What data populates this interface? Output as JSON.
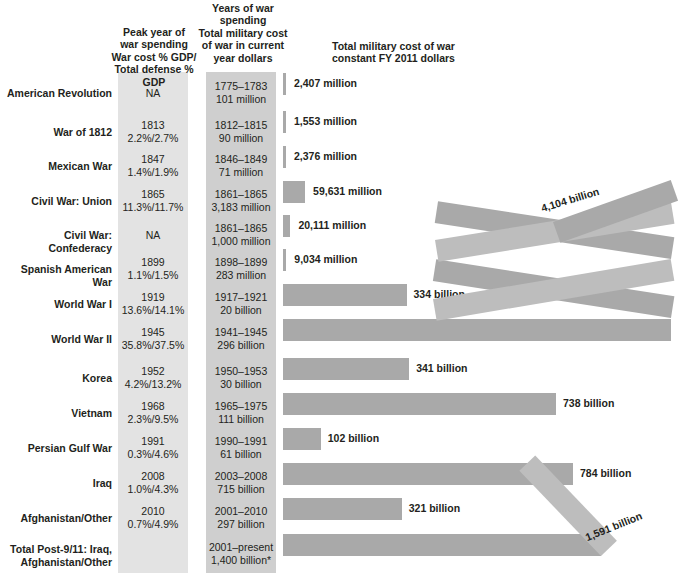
{
  "headers": {
    "war_name": "",
    "peak": "Peak year of\nwar spending\nWar cost % GDP/\nTotal defense % GDP",
    "peak_l1": "Peak year of",
    "peak_l2": "war spending",
    "peak_l3": "War cost % GDP/",
    "peak_l4": "Total defense % GDP",
    "years_l1": "Years of war",
    "years_l2": "spending",
    "years_l3": "Total military cost",
    "years_l4": "of war in current",
    "years_l5": "year dollars",
    "chart_l1": "Total military cost of war",
    "chart_l2": "constant FY 2011 dollars"
  },
  "footnote": "*",
  "colors": {
    "bar": "#a9a9a9",
    "bar_fold": "#bdbdbd",
    "band_peak": "#e3e3e3",
    "band_years": "#cfcfcf",
    "text": "#231f20"
  },
  "chart_data": {
    "type": "bar",
    "title": "Total military cost of war constant FY 2011 dollars",
    "xlabel": "Constant FY 2011 dollars",
    "ylabel": "War",
    "orientation": "horizontal",
    "grid": false,
    "legend": false,
    "note": "Values in billions of constant FY 2011 dollars; million-scale wars drawn as minimal stubs. Two largest bars (World War II and Total Post-9/11) are drawn as folded ribbons that wrap back across the chart.",
    "categories": [
      "American Revolution",
      "War of 1812",
      "Mexican War",
      "Civil War: Union",
      "Civil War: Confederacy",
      "Spanish American War",
      "World War I",
      "World War II",
      "Korea",
      "Vietnam",
      "Persian Gulf War",
      "Iraq",
      "Afghanistan/Other",
      "Total Post-9/11: Iraq, Afghanistan/Other"
    ],
    "values_billions": [
      2.407,
      1.553,
      2.376,
      59.631,
      20.111,
      9.034,
      334,
      4104,
      341,
      738,
      102,
      784,
      321,
      1591
    ],
    "value_labels": [
      "2,407 million",
      "1,553 million",
      "2,376 million",
      "59,631 million",
      "20,111 million",
      "9,034 million",
      "334 billion",
      "4,104 billion",
      "341 billion",
      "738 billion",
      "102 billion",
      "784 billion",
      "321 billion",
      "1,591 billion"
    ]
  },
  "rows": [
    {
      "name_l1": "American Revolution",
      "name_l2": "",
      "peak_year": "NA",
      "peak_pct": "",
      "years": "1775–1783",
      "cost": "101 million",
      "bar_label": "2,407 million"
    },
    {
      "name_l1": "War of 1812",
      "name_l2": "",
      "peak_year": "1813",
      "peak_pct": "2.2%/2.7%",
      "years": "1812–1815",
      "cost": "90 million",
      "bar_label": "1,553 million"
    },
    {
      "name_l1": "Mexican War",
      "name_l2": "",
      "peak_year": "1847",
      "peak_pct": "1.4%/1.9%",
      "years": "1846–1849",
      "cost": "71 million",
      "bar_label": "2,376 million"
    },
    {
      "name_l1": "Civil War: Union",
      "name_l2": "",
      "peak_year": "1865",
      "peak_pct": "11.3%/11.7%",
      "years": "1861–1865",
      "cost": "3,183 million",
      "bar_label": "59,631 million"
    },
    {
      "name_l1": "Civil War: Confederacy",
      "name_l2": "",
      "peak_year": "NA",
      "peak_pct": "",
      "years": "1861–1865",
      "cost": "1,000 million",
      "bar_label": "20,111 million"
    },
    {
      "name_l1": "Spanish American War",
      "name_l2": "",
      "peak_year": "1899",
      "peak_pct": "1.1%/1.5%",
      "years": "1898–1899",
      "cost": "283 million",
      "bar_label": "9,034 million"
    },
    {
      "name_l1": "World War I",
      "name_l2": "",
      "peak_year": "1919",
      "peak_pct": "13.6%/14.1%",
      "years": "1917–1921",
      "cost": "20 billion",
      "bar_label": "334 billion"
    },
    {
      "name_l1": "World War II",
      "name_l2": "",
      "peak_year": "1945",
      "peak_pct": "35.8%/37.5%",
      "years": "1941–1945",
      "cost": "296 billion",
      "bar_label": "4,104 billion"
    },
    {
      "name_l1": "Korea",
      "name_l2": "",
      "peak_year": "1952",
      "peak_pct": "4.2%/13.2%",
      "years": "1950–1953",
      "cost": "30 billion",
      "bar_label": "341 billion"
    },
    {
      "name_l1": "Vietnam",
      "name_l2": "",
      "peak_year": "1968",
      "peak_pct": "2.3%/9.5%",
      "years": "1965–1975",
      "cost": "111 billion",
      "bar_label": "738 billion"
    },
    {
      "name_l1": "Persian Gulf War",
      "name_l2": "",
      "peak_year": "1991",
      "peak_pct": "0.3%/4.6%",
      "years": "1990–1991",
      "cost": "61 billion",
      "bar_label": "102 billion"
    },
    {
      "name_l1": "Iraq",
      "name_l2": "",
      "peak_year": "2008",
      "peak_pct": "1.0%/4.3%",
      "years": "2003–2008",
      "cost": "715 billion",
      "bar_label": "784 billion"
    },
    {
      "name_l1": "Afghanistan/Other",
      "name_l2": "",
      "peak_year": "2010",
      "peak_pct": "0.7%/4.9%",
      "years": "2001–2010",
      "cost": "297 billion",
      "bar_label": "321 billion"
    },
    {
      "name_l1": "Total Post-9/11: Iraq,",
      "name_l2": "Afghanistan/Other",
      "peak_year": "",
      "peak_pct": "",
      "years": "2001–present",
      "cost": "1,400 billion*",
      "bar_label": "1,591 billion"
    }
  ]
}
